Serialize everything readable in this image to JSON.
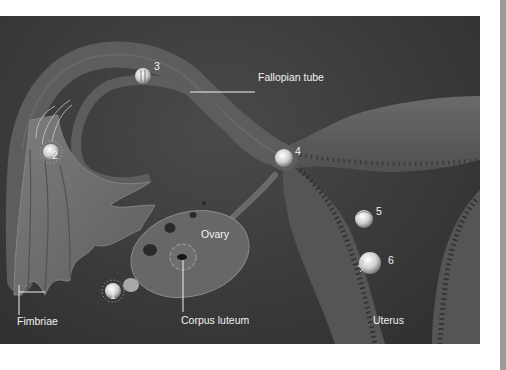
{
  "diagram": {
    "labels": {
      "fallopian_tube": "Fallopian tube",
      "ovary": "Ovary",
      "fimbriae": "Fimbriae",
      "corpus_luteum": "Corpus luteum",
      "uterus": "Uterus"
    },
    "stages": [
      {
        "number": "1",
        "location": "ovulation at ovary surface"
      },
      {
        "number": "2",
        "location": "egg near fimbriae with sperm"
      },
      {
        "number": "3",
        "location": "zygote in fallopian tube"
      },
      {
        "number": "4",
        "location": "cleavage near uterine junction"
      },
      {
        "number": "5",
        "location": "blastocyst in uterine cavity"
      },
      {
        "number": "6",
        "location": "implantation in uterine wall"
      }
    ],
    "colors": {
      "background": "#3a3a3a",
      "tissue": "#5a5a5a",
      "highlight": "#d8d8d8",
      "text": "#f2f2f2",
      "page": "#ffffff",
      "scrollbar": "#9a9a9a"
    }
  }
}
